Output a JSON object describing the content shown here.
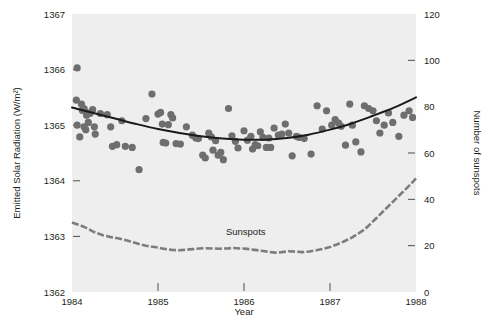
{
  "chart_data": {
    "type": "scatter",
    "title": "",
    "subtitle": "",
    "xlabel": "Year",
    "ylabel": "Emitted Solar Radiation (W/m²)",
    "y2label": "Number of sunspots",
    "xlim": [
      1984,
      1988
    ],
    "ylim": [
      1362,
      1367
    ],
    "y2lim": [
      0,
      120
    ],
    "xticks": [
      1984,
      1985,
      1986,
      1987,
      1988
    ],
    "xticklabels": [
      "1984",
      "1985",
      "1986",
      "1987",
      "1988"
    ],
    "yticks": [
      1362,
      1363,
      1364,
      1365,
      1366,
      1367
    ],
    "yticklabels": [
      "1362",
      "1363",
      "1364",
      "1365",
      "1366",
      "1367"
    ],
    "y2ticks": [
      0,
      20,
      40,
      60,
      80,
      100,
      120
    ],
    "y2ticklabels": [
      "0",
      "20",
      "40",
      "60",
      "80",
      "100",
      "120"
    ],
    "grid": false,
    "legend_position": "none",
    "plot_background": "#eeeeee",
    "colors": {
      "scatter": "#6e6e6e",
      "fit_curve": "#1a1a1a",
      "sunspots": "#7d7d7d",
      "text": "#231f20",
      "plot_area": "#eeeeee",
      "figure_background": "#ffffff"
    },
    "annotations": [
      {
        "text": "Sunspots",
        "x": 1986.02,
        "y": 1363.03,
        "axis": "left"
      }
    ],
    "series": [
      {
        "name": "Emitted Solar Radiation",
        "type": "scatter",
        "axis": "left",
        "marker": "circle",
        "color": "#6e6e6e",
        "points": [
          [
            1984.06,
            1366.03
          ],
          [
            1984.05,
            1365.45
          ],
          [
            1984.11,
            1365.38
          ],
          [
            1984.12,
            1365.27
          ],
          [
            1984.14,
            1365.3
          ],
          [
            1984.16,
            1365.24
          ],
          [
            1984.17,
            1365.18
          ],
          [
            1984.06,
            1365.0
          ],
          [
            1984.09,
            1364.79
          ],
          [
            1984.14,
            1364.97
          ],
          [
            1984.16,
            1364.92
          ],
          [
            1984.19,
            1365.05
          ],
          [
            1984.21,
            1365.21
          ],
          [
            1984.24,
            1365.28
          ],
          [
            1984.26,
            1364.97
          ],
          [
            1984.27,
            1364.84
          ],
          [
            1984.33,
            1365.21
          ],
          [
            1984.41,
            1365.19
          ],
          [
            1984.45,
            1364.97
          ],
          [
            1984.47,
            1364.62
          ],
          [
            1984.52,
            1364.65
          ],
          [
            1984.58,
            1365.08
          ],
          [
            1984.62,
            1364.62
          ],
          [
            1984.7,
            1364.6
          ],
          [
            1984.78,
            1364.2
          ],
          [
            1984.86,
            1365.12
          ],
          [
            1984.93,
            1365.56
          ],
          [
            1985.0,
            1365.2
          ],
          [
            1985.03,
            1365.23
          ],
          [
            1985.05,
            1365.02
          ],
          [
            1985.06,
            1364.69
          ],
          [
            1985.09,
            1364.68
          ],
          [
            1985.12,
            1365.01
          ],
          [
            1985.15,
            1365.19
          ],
          [
            1985.17,
            1365.13
          ],
          [
            1985.21,
            1364.67
          ],
          [
            1985.26,
            1364.66
          ],
          [
            1985.33,
            1364.97
          ],
          [
            1985.4,
            1364.82
          ],
          [
            1985.44,
            1364.77
          ],
          [
            1985.47,
            1364.76
          ],
          [
            1985.52,
            1364.46
          ],
          [
            1985.55,
            1364.41
          ],
          [
            1985.59,
            1364.86
          ],
          [
            1985.62,
            1364.79
          ],
          [
            1985.64,
            1364.55
          ],
          [
            1985.67,
            1364.72
          ],
          [
            1985.7,
            1364.46
          ],
          [
            1985.73,
            1364.51
          ],
          [
            1985.76,
            1364.38
          ],
          [
            1985.82,
            1365.3
          ],
          [
            1985.86,
            1364.81
          ],
          [
            1985.9,
            1364.71
          ],
          [
            1985.93,
            1364.59
          ],
          [
            1986.0,
            1364.9
          ],
          [
            1986.04,
            1364.73
          ],
          [
            1986.08,
            1364.8
          ],
          [
            1986.1,
            1364.57
          ],
          [
            1986.13,
            1364.65
          ],
          [
            1986.16,
            1364.63
          ],
          [
            1986.19,
            1364.88
          ],
          [
            1986.22,
            1364.78
          ],
          [
            1986.26,
            1364.6
          ],
          [
            1986.29,
            1364.77
          ],
          [
            1986.31,
            1364.6
          ],
          [
            1986.35,
            1364.95
          ],
          [
            1986.4,
            1364.82
          ],
          [
            1986.44,
            1364.84
          ],
          [
            1986.48,
            1365.02
          ],
          [
            1986.52,
            1364.86
          ],
          [
            1986.56,
            1364.45
          ],
          [
            1986.61,
            1364.8
          ],
          [
            1986.64,
            1364.78
          ],
          [
            1986.7,
            1364.76
          ],
          [
            1986.78,
            1364.48
          ],
          [
            1986.85,
            1365.35
          ],
          [
            1986.91,
            1364.93
          ],
          [
            1986.96,
            1365.26
          ],
          [
            1987.02,
            1365.0
          ],
          [
            1987.06,
            1365.1
          ],
          [
            1987.1,
            1365.04
          ],
          [
            1987.13,
            1364.98
          ],
          [
            1987.18,
            1364.64
          ],
          [
            1987.23,
            1365.38
          ],
          [
            1987.26,
            1365.0
          ],
          [
            1987.3,
            1364.7
          ],
          [
            1987.36,
            1364.52
          ],
          [
            1987.4,
            1365.35
          ],
          [
            1987.45,
            1365.3
          ],
          [
            1987.5,
            1365.26
          ],
          [
            1987.54,
            1365.08
          ],
          [
            1987.58,
            1364.86
          ],
          [
            1987.63,
            1365.0
          ],
          [
            1987.68,
            1365.22
          ],
          [
            1987.73,
            1365.05
          ],
          [
            1987.8,
            1364.8
          ],
          [
            1987.86,
            1365.18
          ],
          [
            1987.92,
            1365.26
          ],
          [
            1987.96,
            1365.14
          ]
        ]
      },
      {
        "name": "Fitted trend (quadratic)",
        "type": "line",
        "axis": "left",
        "color": "#1a1a1a",
        "points": [
          [
            1984.0,
            1365.32
          ],
          [
            1984.25,
            1365.22
          ],
          [
            1984.5,
            1365.12
          ],
          [
            1984.75,
            1365.02
          ],
          [
            1985.0,
            1364.93
          ],
          [
            1985.25,
            1364.86
          ],
          [
            1985.5,
            1364.8
          ],
          [
            1985.75,
            1364.76
          ],
          [
            1986.0,
            1364.74
          ],
          [
            1986.25,
            1364.74
          ],
          [
            1986.5,
            1364.77
          ],
          [
            1986.75,
            1364.83
          ],
          [
            1987.0,
            1364.92
          ],
          [
            1987.25,
            1365.03
          ],
          [
            1987.5,
            1365.17
          ],
          [
            1987.75,
            1365.32
          ],
          [
            1988.0,
            1365.5
          ]
        ]
      },
      {
        "name": "Sunspots",
        "type": "line",
        "axis": "right",
        "color": "#7d7d7d",
        "points": [
          [
            1984.0,
            30.0
          ],
          [
            1984.04,
            29.5
          ],
          [
            1984.08,
            29.0
          ],
          [
            1984.12,
            28.4
          ],
          [
            1984.16,
            27.8
          ],
          [
            1984.2,
            27.0
          ],
          [
            1984.24,
            26.2
          ],
          [
            1984.28,
            25.5
          ],
          [
            1984.32,
            25.0
          ],
          [
            1984.36,
            24.5
          ],
          [
            1984.4,
            24.2
          ],
          [
            1984.44,
            23.8
          ],
          [
            1984.5,
            23.4
          ],
          [
            1984.56,
            23.0
          ],
          [
            1984.62,
            22.4
          ],
          [
            1984.68,
            21.8
          ],
          [
            1984.74,
            21.2
          ],
          [
            1984.8,
            20.5
          ],
          [
            1984.86,
            20.0
          ],
          [
            1984.92,
            19.6
          ],
          [
            1985.0,
            19.2
          ],
          [
            1985.08,
            18.6
          ],
          [
            1985.16,
            18.2
          ],
          [
            1985.24,
            18.0
          ],
          [
            1985.32,
            18.2
          ],
          [
            1985.4,
            18.5
          ],
          [
            1985.48,
            18.8
          ],
          [
            1985.56,
            18.9
          ],
          [
            1985.64,
            18.8
          ],
          [
            1985.72,
            18.7
          ],
          [
            1985.8,
            18.8
          ],
          [
            1985.88,
            19.0
          ],
          [
            1985.96,
            18.8
          ],
          [
            1986.04,
            18.6
          ],
          [
            1986.12,
            18.2
          ],
          [
            1986.2,
            17.8
          ],
          [
            1986.28,
            17.4
          ],
          [
            1986.36,
            17.0
          ],
          [
            1986.44,
            17.2
          ],
          [
            1986.52,
            17.6
          ],
          [
            1986.6,
            17.4
          ],
          [
            1986.68,
            17.2
          ],
          [
            1986.76,
            17.5
          ],
          [
            1986.84,
            18.0
          ],
          [
            1986.92,
            18.6
          ],
          [
            1987.0,
            19.4
          ],
          [
            1987.08,
            20.5
          ],
          [
            1987.16,
            21.8
          ],
          [
            1987.24,
            23.2
          ],
          [
            1987.32,
            25.0
          ],
          [
            1987.4,
            27.0
          ],
          [
            1987.46,
            29.0
          ],
          [
            1987.52,
            31.2
          ],
          [
            1987.58,
            33.4
          ],
          [
            1987.64,
            35.6
          ],
          [
            1987.7,
            37.8
          ],
          [
            1987.76,
            40.0
          ],
          [
            1987.82,
            42.2
          ],
          [
            1987.88,
            44.4
          ],
          [
            1987.94,
            46.6
          ],
          [
            1988.0,
            49.0
          ]
        ]
      }
    ]
  }
}
